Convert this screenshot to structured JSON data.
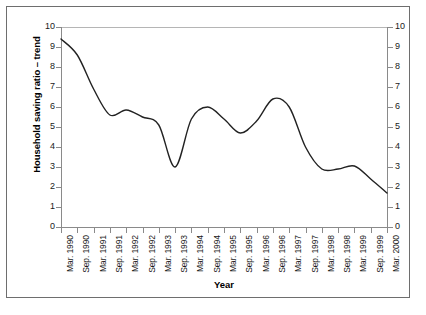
{
  "chart_data": {
    "type": "line",
    "title": "",
    "xlabel": "Year",
    "ylabel": "Household saving ratio – trend",
    "ylim": [
      0,
      10
    ],
    "ylim_right": [
      0,
      10
    ],
    "grid": false,
    "legend": "none",
    "y_ticks": [
      0,
      1,
      2,
      3,
      4,
      5,
      6,
      7,
      8,
      9,
      10
    ],
    "y_ticks_right": [
      0,
      1,
      2,
      3,
      4,
      5,
      6,
      7,
      8,
      9,
      10
    ],
    "categories": [
      "Mar. 1990",
      "Sep. 1990",
      "Mar. 1991",
      "Sep. 1991",
      "Mar. 1992",
      "Sep. 1992",
      "Mar. 1993",
      "Sep. 1993",
      "Mar. 1994",
      "Sep. 1994",
      "Mar. 1995",
      "Sep. 1995",
      "Mar. 1996",
      "Sep. 1996",
      "Mar. 1997",
      "Sep. 1997",
      "Mar. 1998",
      "Sep. 1998",
      "Mar. 1999",
      "Sep. 1999",
      "Mar. 2000"
    ],
    "series": [
      {
        "name": "Household saving ratio – trend",
        "color": "#222222",
        "values": [
          9.4,
          8.6,
          6.9,
          5.6,
          5.85,
          5.5,
          5.1,
          3.0,
          5.4,
          6.0,
          5.4,
          4.7,
          5.3,
          6.4,
          6.0,
          4.0,
          2.9,
          2.9,
          3.05,
          2.4,
          1.7
        ]
      }
    ]
  }
}
